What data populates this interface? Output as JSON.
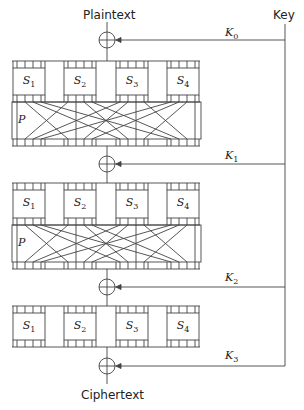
{
  "diagram": {
    "title_top": "Plaintext",
    "title_bottom": "Ciphertext",
    "key_label": "Key",
    "stroke_color": "#444444",
    "round_keys": [
      {
        "base": "K",
        "sub": "0"
      },
      {
        "base": "K",
        "sub": "1"
      },
      {
        "base": "K",
        "sub": "2"
      },
      {
        "base": "K",
        "sub": "3"
      }
    ],
    "sbox_rows": [
      {
        "sboxes": [
          {
            "base": "S",
            "sub": "1"
          },
          {
            "base": "S",
            "sub": "2"
          },
          {
            "base": "S",
            "sub": "3"
          },
          {
            "base": "S",
            "sub": "4"
          }
        ],
        "has_permutation": true,
        "perm_label": "P"
      },
      {
        "sboxes": [
          {
            "base": "S",
            "sub": "1"
          },
          {
            "base": "S",
            "sub": "2"
          },
          {
            "base": "S",
            "sub": "3"
          },
          {
            "base": "S",
            "sub": "4"
          }
        ],
        "has_permutation": true,
        "perm_label": "P"
      },
      {
        "sboxes": [
          {
            "base": "S",
            "sub": "1"
          },
          {
            "base": "S",
            "sub": "2"
          },
          {
            "base": "S",
            "sub": "3"
          },
          {
            "base": "S",
            "sub": "4"
          }
        ],
        "has_permutation": false
      }
    ],
    "xor_symbol": "⊕"
  }
}
